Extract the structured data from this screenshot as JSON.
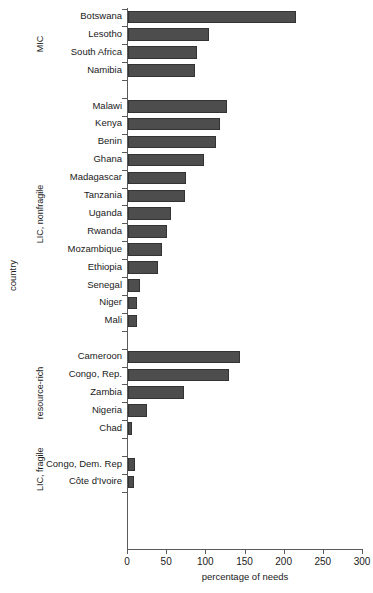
{
  "chart_data": {
    "type": "bar",
    "orientation": "horizontal",
    "title": "",
    "xlabel": "percentage of needs",
    "ylabel": "country",
    "xlim": [
      0,
      300
    ],
    "xticks": [
      0,
      50,
      100,
      150,
      200,
      250,
      300
    ],
    "grid": false,
    "legend": null,
    "bar_color": "#4d4d4d",
    "bar_edge_color": "#333333",
    "groups": [
      {
        "name": "MIC",
        "categories": [
          "Botswana",
          "Lesotho",
          "South Africa",
          "Namibia"
        ],
        "values": [
          214,
          103,
          88,
          85
        ]
      },
      {
        "name": "LIC, nonfragile",
        "categories": [
          "Malawi",
          "Kenya",
          "Benin",
          "Ghana",
          "Madagascar",
          "Tanzania",
          "Uganda",
          "Rwanda",
          "Mozambique",
          "Ethiopia",
          "Senegal",
          "Niger",
          "Mali"
        ],
        "values": [
          126,
          118,
          112,
          97,
          74,
          73,
          55,
          50,
          44,
          38,
          15,
          12,
          12
        ]
      },
      {
        "name": "resource-rich",
        "categories": [
          "Cameroon",
          "Congo, Rep.",
          "Zambia",
          "Nigeria",
          "Chad"
        ],
        "values": [
          143,
          129,
          72,
          24,
          5
        ]
      },
      {
        "name": "LIC, fragile",
        "categories": [
          "Congo, Dem. Rep",
          "Côte d'Ivoire"
        ],
        "values": [
          9,
          8
        ]
      }
    ]
  },
  "axes": {
    "x_title": "percentage of needs",
    "y_title": "country",
    "x_tick_labels": [
      "0",
      "50",
      "100",
      "150",
      "200",
      "250",
      "300"
    ]
  },
  "groups": [
    {
      "label": "MIC"
    },
    {
      "label": "LIC, nonfragile"
    },
    {
      "label": "resource-rich"
    },
    {
      "label": "LIC, fragile"
    }
  ],
  "rows": [
    {
      "label": "Botswana",
      "value": 214
    },
    {
      "label": "Lesotho",
      "value": 103
    },
    {
      "label": "South Africa",
      "value": 88
    },
    {
      "label": "Namibia",
      "value": 85
    },
    {
      "label": "Malawi",
      "value": 126
    },
    {
      "label": "Kenya",
      "value": 118
    },
    {
      "label": "Benin",
      "value": 112
    },
    {
      "label": "Ghana",
      "value": 97
    },
    {
      "label": "Madagascar",
      "value": 74
    },
    {
      "label": "Tanzania",
      "value": 73
    },
    {
      "label": "Uganda",
      "value": 55
    },
    {
      "label": "Rwanda",
      "value": 50
    },
    {
      "label": "Mozambique",
      "value": 44
    },
    {
      "label": "Ethiopia",
      "value": 38
    },
    {
      "label": "Senegal",
      "value": 15
    },
    {
      "label": "Niger",
      "value": 12
    },
    {
      "label": "Mali",
      "value": 12
    },
    {
      "label": "Cameroon",
      "value": 143
    },
    {
      "label": "Congo, Rep.",
      "value": 129
    },
    {
      "label": "Zambia",
      "value": 72
    },
    {
      "label": "Nigeria",
      "value": 24
    },
    {
      "label": "Chad",
      "value": 5
    },
    {
      "label": "Congo, Dem. Rep",
      "value": 9
    },
    {
      "label": "Côte d'Ivoire",
      "value": 8
    }
  ]
}
